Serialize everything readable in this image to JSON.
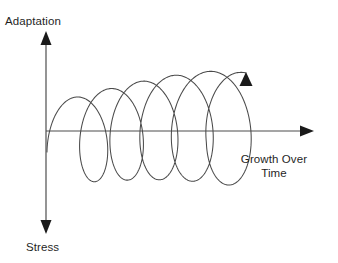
{
  "figure": {
    "title_text": "Adaptation vs Stress Growth Spiral",
    "background_color": "#ffffff",
    "line_color": "#4a4a4a",
    "arrow_color": "#1a1a1a",
    "text_color": "#1f1f1f"
  },
  "axes": {
    "vertical": {
      "top_label": "Adaptation",
      "bottom_label": "Stress",
      "x": 46,
      "top_y": 32,
      "bottom_y": 233,
      "has_top_arrow": true,
      "has_bottom_arrow": true
    },
    "horizontal": {
      "label_line1": "Growth Over",
      "label_line2": "Time",
      "label_full": "Growth Over Time",
      "y": 131,
      "left_x": 46,
      "right_x": 313,
      "has_right_arrow": true
    }
  },
  "chart_data": {
    "type": "line",
    "xlabel": "Growth Over Time",
    "ylabel": "Adaptation / Stress",
    "ylabel_positive": "Adaptation",
    "ylabel_negative": "Stress",
    "grid": false,
    "legend": "none",
    "series": [
      {
        "name": "Ascending growth spiral",
        "shape": "helix",
        "loops": 5,
        "direction": "left-to-right ascending",
        "start_point": [
          47,
          152
        ],
        "end_point": [
          246,
          73
        ],
        "end_marker": "arrow-up",
        "loop_centers_x": [
          86,
          118,
          150,
          182,
          214
        ],
        "loop_centers_y": [
          140,
          134,
          128,
          122,
          116
        ],
        "loop_radius_x": [
          20,
          23,
          26,
          29,
          32
        ],
        "loop_radius_y": [
          42,
          46,
          50,
          54,
          58
        ],
        "notes": "Spiral starts below the axis at lower left, coils upward with increasing amplitude, exits upward through an arrowhead at the right."
      }
    ],
    "annotations": [
      {
        "text": "Adaptation",
        "position": "top of vertical axis"
      },
      {
        "text": "Stress",
        "position": "bottom of vertical axis"
      },
      {
        "text": "Growth Over Time",
        "position": "right of horizontal axis"
      }
    ]
  }
}
